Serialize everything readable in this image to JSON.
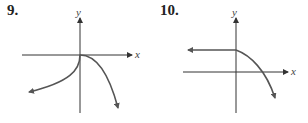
{
  "problems": [
    {
      "number": "9.",
      "x_label": "x",
      "y_label": "y",
      "description": "Graph through origin: left branch rises to origin from lower-left, right branch falls steeply from origin to lower-right"
    },
    {
      "number": "10.",
      "x_label": "x",
      "y_label": "y",
      "description": "Horizontal ray to the left at positive y-intercept, then curve decreasing to the right crossing the x-axis"
    }
  ],
  "colors": {
    "axis": "#333333",
    "curve": "#555555",
    "text": "#222222"
  }
}
